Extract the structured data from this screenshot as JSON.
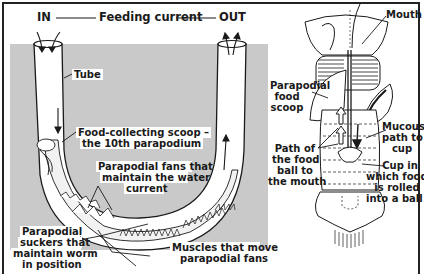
{
  "header": {
    "in_label": "IN",
    "current_label": "Feeding current",
    "out_label": "OUT"
  },
  "left_diagram": {
    "labels": {
      "tube": "Tube",
      "scoop_line1": "Food-collecting scoop –",
      "scoop_line2": "the 10th parapodium",
      "fans_line1": "Parapodial fans that",
      "fans_line2": "maintain the water",
      "fans_line3": "current",
      "suckers_line1": "Parapodial",
      "suckers_line2": "suckers that",
      "suckers_line3": "maintain worm",
      "suckers_line4": "in position",
      "muscles_line1": "Muscles that move",
      "muscles_line2": "parapodial fans"
    },
    "colors": {
      "background_gray": "#c9c9c9",
      "line": "#1a1a1a"
    }
  },
  "right_diagram": {
    "labels": {
      "mouth": "Mouth",
      "food_scoop_line1": "Parapodial",
      "food_scoop_line2": "food",
      "food_scoop_line3": "scoop",
      "mucous_line1": "Mucous",
      "mucous_line2": "path to",
      "mucous_line3": "cup",
      "path_line1": "Path of",
      "path_line2": "the food",
      "path_line3": "ball to",
      "path_line4": "the mouth",
      "cup_line1": "Cup in",
      "cup_line2": "which food",
      "cup_line3": "is rolled",
      "cup_line4": "into a ball"
    }
  }
}
